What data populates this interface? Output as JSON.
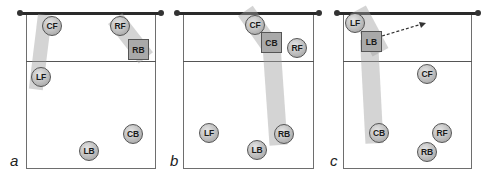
{
  "colors": {
    "net": "#2a2a2a",
    "court_line": "#6e6e6e",
    "band": "#a0a0a0",
    "player_fill": "#bdbdbd",
    "setter_fill": "#a9a9a9"
  },
  "panels": [
    {
      "label": "a",
      "players": [
        {
          "id": "CF",
          "label": "CF"
        },
        {
          "id": "RF",
          "label": "RF"
        },
        {
          "id": "LF",
          "label": "LF"
        },
        {
          "id": "CB",
          "label": "CB"
        },
        {
          "id": "LB",
          "label": "LB"
        }
      ],
      "setter": {
        "id": "RB",
        "label": "RB"
      }
    },
    {
      "label": "b",
      "players": [
        {
          "id": "CF",
          "label": "CF"
        },
        {
          "id": "RF",
          "label": "RF"
        },
        {
          "id": "LF",
          "label": "LF"
        },
        {
          "id": "RB",
          "label": "RB"
        },
        {
          "id": "LB",
          "label": "LB"
        }
      ],
      "setter": {
        "id": "CB",
        "label": "CB"
      }
    },
    {
      "label": "c",
      "players": [
        {
          "id": "LF",
          "label": "LF"
        },
        {
          "id": "CF",
          "label": "CF"
        },
        {
          "id": "CB",
          "label": "CB"
        },
        {
          "id": "RF",
          "label": "RF"
        },
        {
          "id": "RB",
          "label": "RB"
        }
      ],
      "setter": {
        "id": "LB",
        "label": "LB"
      },
      "arrow": "dashed-arrow-right"
    }
  ]
}
